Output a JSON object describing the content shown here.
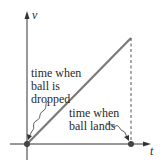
{
  "diagram": {
    "type": "velocity-time graph",
    "axes": {
      "x_label": "t",
      "y_label": "v"
    },
    "annotations": {
      "dropped": [
        "time when",
        "ball is",
        "dropped"
      ],
      "lands": [
        "time when",
        "ball lands"
      ]
    },
    "colors": {
      "axis": "#333333",
      "line": "#7a7a7a",
      "dot": "#444444",
      "text": "#2a2a2a"
    }
  }
}
